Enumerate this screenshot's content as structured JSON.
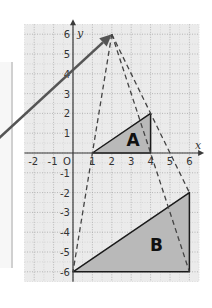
{
  "diagram": {
    "title": "",
    "type": "enlargement",
    "axes": {
      "x_label": "x",
      "y_label": "y",
      "origin_label": "O",
      "x_range": [
        -2,
        6
      ],
      "y_range": [
        -6,
        6
      ],
      "x_ticks": [
        "-2",
        "-1",
        "1",
        "2",
        "3",
        "4",
        "5",
        "6"
      ],
      "y_ticks": [
        "6",
        "5",
        "4",
        "3",
        "2",
        "1",
        "-1",
        "-2",
        "-3",
        "-4",
        "-5",
        "-6"
      ]
    },
    "center_of_enlargement": [
      2,
      6
    ],
    "scale_factor": 2,
    "shapes": [
      {
        "label": "A",
        "vertices": [
          [
            1,
            0
          ],
          [
            4,
            2
          ],
          [
            4,
            0
          ]
        ],
        "fill": "#b9b9b9"
      },
      {
        "label": "B",
        "vertices": [
          [
            0,
            -6
          ],
          [
            6,
            -2
          ],
          [
            6,
            -6
          ]
        ],
        "fill": "#b9b9b9"
      }
    ],
    "rays": [
      {
        "from": [
          2,
          6
        ],
        "to": [
          0,
          -6
        ]
      },
      {
        "from": [
          2,
          6
        ],
        "to": [
          6,
          -2
        ]
      },
      {
        "from": [
          2,
          6
        ],
        "to": [
          6,
          -6
        ]
      }
    ],
    "pointer_arrow": {
      "from": [
        -4.2,
        0.4
      ],
      "to": [
        2,
        6
      ],
      "color": "#555555"
    },
    "colors": {
      "grid_bg": "#ebebeb",
      "grid_line": "#a8a8a8",
      "axis": "#3a3a3a",
      "shape_fill": "#b9b9b9",
      "shape_stroke": "#1a1a1a",
      "dashed": "#444444"
    }
  }
}
